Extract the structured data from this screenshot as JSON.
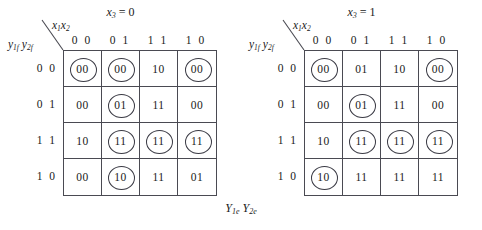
{
  "figure": {
    "caption_main": "Y",
    "caption": "Y1e Y2e",
    "caption_y1": "Y",
    "caption_sub1": "1e",
    "caption_y2": "Y",
    "caption_sub2": "2e"
  },
  "maps": [
    {
      "id": "left",
      "title_var": "x",
      "title_sub": "3",
      "title_eq": " = 0",
      "title": "x3 = 0",
      "col_var": "x1x2",
      "col_var_v1": "x",
      "col_var_s1": "1",
      "col_var_v2": "x",
      "col_var_s2": "2",
      "row_var": "y1f y2f",
      "row_var_v1": "y",
      "row_var_s1": "1f",
      "row_var_v2": "y",
      "row_var_s2": "2f",
      "col_headers": [
        "0 0",
        "0 1",
        "1 1",
        "1 0"
      ],
      "row_headers": [
        "0 0",
        "0 1",
        "1 1",
        "1 0"
      ],
      "cells": [
        [
          {
            "value": "00",
            "circled": true
          },
          {
            "value": "00",
            "circled": true
          },
          {
            "value": "10",
            "circled": false
          },
          {
            "value": "00",
            "circled": true
          }
        ],
        [
          {
            "value": "00",
            "circled": false
          },
          {
            "value": "01",
            "circled": true
          },
          {
            "value": "11",
            "circled": false
          },
          {
            "value": "00",
            "circled": false
          }
        ],
        [
          {
            "value": "10",
            "circled": false
          },
          {
            "value": "11",
            "circled": true
          },
          {
            "value": "11",
            "circled": true
          },
          {
            "value": "11",
            "circled": true
          }
        ],
        [
          {
            "value": "00",
            "circled": false
          },
          {
            "value": "10",
            "circled": true
          },
          {
            "value": "11",
            "circled": false
          },
          {
            "value": "01",
            "circled": false
          }
        ]
      ]
    },
    {
      "id": "right",
      "title_var": "x",
      "title_sub": "3",
      "title_eq": " = 1",
      "title": "x3 = 1",
      "col_var": "x1x2",
      "col_var_v1": "x",
      "col_var_s1": "1",
      "col_var_v2": "x",
      "col_var_s2": "2",
      "row_var": "y1f y2f",
      "row_var_v1": "y",
      "row_var_s1": "1f",
      "row_var_v2": "y",
      "row_var_s2": "2f",
      "col_headers": [
        "0 0",
        "0 1",
        "1 1",
        "1 0"
      ],
      "row_headers": [
        "0 0",
        "0 1",
        "1 1",
        "1 0"
      ],
      "cells": [
        [
          {
            "value": "00",
            "circled": true
          },
          {
            "value": "01",
            "circled": false
          },
          {
            "value": "10",
            "circled": false
          },
          {
            "value": "00",
            "circled": true
          }
        ],
        [
          {
            "value": "00",
            "circled": false
          },
          {
            "value": "01",
            "circled": true
          },
          {
            "value": "11",
            "circled": false
          },
          {
            "value": "00",
            "circled": false
          }
        ],
        [
          {
            "value": "10",
            "circled": false
          },
          {
            "value": "11",
            "circled": true
          },
          {
            "value": "11",
            "circled": true
          },
          {
            "value": "11",
            "circled": true
          }
        ],
        [
          {
            "value": "10",
            "circled": true
          },
          {
            "value": "11",
            "circled": false
          },
          {
            "value": "11",
            "circled": false
          },
          {
            "value": "11",
            "circled": false
          }
        ]
      ]
    }
  ],
  "colors": {
    "grid_line": "#4a4a52",
    "text": "#1a1a1a",
    "ring": "#3a3a44",
    "background": "#ffffff"
  }
}
